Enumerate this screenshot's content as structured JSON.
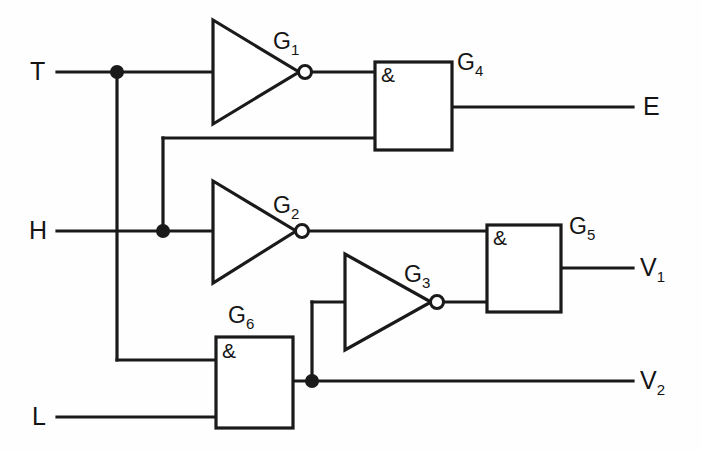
{
  "diagram": {
    "background_color": "#fefefe",
    "line_color": "#1a1a1a",
    "inputs": [
      {
        "name": "T",
        "label": "T",
        "x": 42,
        "y": 72
      },
      {
        "name": "H",
        "label": "H",
        "x": 42,
        "y": 231
      },
      {
        "name": "L",
        "label": "L",
        "x": 42,
        "y": 417
      }
    ],
    "outputs": [
      {
        "name": "E",
        "label": "E",
        "x": 648,
        "y": 107
      },
      {
        "name": "V1",
        "label": "V",
        "sub": "1",
        "x": 645,
        "y": 268
      },
      {
        "name": "V2",
        "label": "V",
        "sub": "2",
        "x": 645,
        "y": 381
      }
    ],
    "gates": [
      {
        "name": "G1",
        "label": "G",
        "sub": "1",
        "type": "inverter",
        "label_x": 277,
        "label_y": 42
      },
      {
        "name": "G2",
        "label": "G",
        "sub": "2",
        "type": "inverter",
        "label_x": 277,
        "label_y": 206
      },
      {
        "name": "G3",
        "label": "G",
        "sub": "3",
        "type": "inverter",
        "label_x": 408,
        "label_y": 275
      },
      {
        "name": "G4",
        "label": "G",
        "sub": "4",
        "type": "and",
        "symbol": "&",
        "label_x": 460,
        "label_y": 62
      },
      {
        "name": "G5",
        "label": "G",
        "sub": "5",
        "type": "and",
        "symbol": "&",
        "label_x": 572,
        "label_y": 226
      },
      {
        "name": "G6",
        "label": "G",
        "sub": "6",
        "type": "and",
        "symbol": "&",
        "label_x": 231,
        "label_y": 315
      }
    ],
    "and_symbols": [
      {
        "gate": "G4",
        "symbol": "&",
        "x": 381,
        "y": 65
      },
      {
        "gate": "G5",
        "symbol": "&",
        "x": 493,
        "y": 228
      },
      {
        "gate": "G6",
        "symbol": "&",
        "x": 222,
        "y": 341
      }
    ],
    "junction_dots": [
      {
        "name": "t-branch",
        "x": 117,
        "y": 72
      },
      {
        "name": "h-branch",
        "x": 163,
        "y": 231
      },
      {
        "name": "g6-output-branch",
        "x": 312,
        "y": 381
      }
    ],
    "nets": [
      {
        "name": "T-to-G1-and-G6",
        "from": "T",
        "to": [
          "G1.in",
          "G6.in1"
        ]
      },
      {
        "name": "H-to-G2-and-G4",
        "from": "H",
        "to": [
          "G2.in",
          "G4.in2"
        ]
      },
      {
        "name": "L-to-G6",
        "from": "L",
        "to": [
          "G6.in2"
        ]
      },
      {
        "name": "G1-to-G4",
        "from": "G1.out",
        "to": [
          "G4.in1"
        ]
      },
      {
        "name": "G2-to-G5",
        "from": "G2.out",
        "to": [
          "G5.in1"
        ]
      },
      {
        "name": "G3-to-G5",
        "from": "G3.out",
        "to": [
          "G5.in2"
        ]
      },
      {
        "name": "G6-to-G3-and-V2",
        "from": "G6.out",
        "to": [
          "G3.in",
          "V2"
        ]
      },
      {
        "name": "G4-to-E",
        "from": "G4.out",
        "to": [
          "E"
        ]
      },
      {
        "name": "G5-to-V1",
        "from": "G5.out",
        "to": [
          "V1"
        ]
      }
    ]
  }
}
